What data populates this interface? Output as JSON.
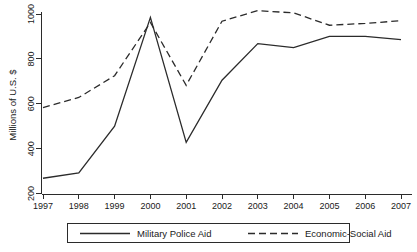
{
  "chart_data": {
    "type": "line",
    "title": "",
    "subtitle": "",
    "xlabel": "",
    "ylabel": "Millions of U.S. $",
    "x": [
      1997,
      1998,
      1999,
      2000,
      2001,
      2002,
      2003,
      2004,
      2005,
      2006,
      2007
    ],
    "xtick_labels": [
      "1997",
      "1998",
      "1999",
      "2000",
      "2001",
      "2002",
      "2003",
      "2004",
      "2005",
      "2006",
      "2007"
    ],
    "ytick_labels": [
      "200",
      "400",
      "600",
      "800",
      "1000"
    ],
    "yticks": [
      200,
      400,
      600,
      800,
      1000
    ],
    "xlim": [
      1997,
      2007
    ],
    "ylim": [
      200,
      1040
    ],
    "grid": false,
    "legend_position": "bottom",
    "series": [
      {
        "name": "Military Police Aid",
        "style": "solid",
        "color": "#2b2b2b",
        "values": [
          268,
          292,
          500,
          985,
          428,
          705,
          868,
          850,
          900,
          900,
          886
        ]
      },
      {
        "name": "Economic-Social Aid",
        "style": "dashed",
        "color": "#2b2b2b",
        "values": [
          583,
          628,
          725,
          962,
          682,
          968,
          1015,
          1005,
          950,
          958,
          970
        ]
      }
    ],
    "legend": [
      {
        "label": "Military Police Aid",
        "style": "solid"
      },
      {
        "label": "Economic-Social Aid",
        "style": "dashed"
      }
    ]
  }
}
